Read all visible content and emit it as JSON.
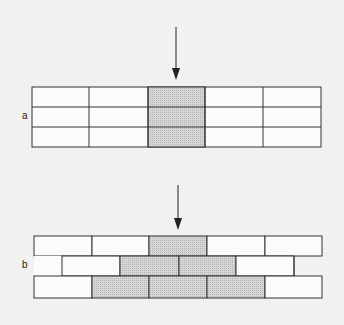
{
  "figure": {
    "panel_a": {
      "label": "a",
      "description": "Stacked grid, aligned joints, 3 rows x 5 columns, arrow loads middle column",
      "rows": 3,
      "columns": 5,
      "shaded_cells": [
        [
          0,
          2
        ],
        [
          1,
          2
        ],
        [
          2,
          2
        ]
      ]
    },
    "panel_b": {
      "label": "b",
      "description": "Running bond with staggered middle row, arrow load spreads to shaded bricks",
      "rows": 3,
      "shaded": {
        "row0": [
          2
        ],
        "row1": [
          1,
          2
        ],
        "row2": [
          1,
          2,
          3
        ]
      }
    },
    "colors": {
      "background": "#f1f1ef",
      "line": "#333333",
      "shade": "#cfcfcf",
      "cell": "#fbfbfa"
    }
  }
}
